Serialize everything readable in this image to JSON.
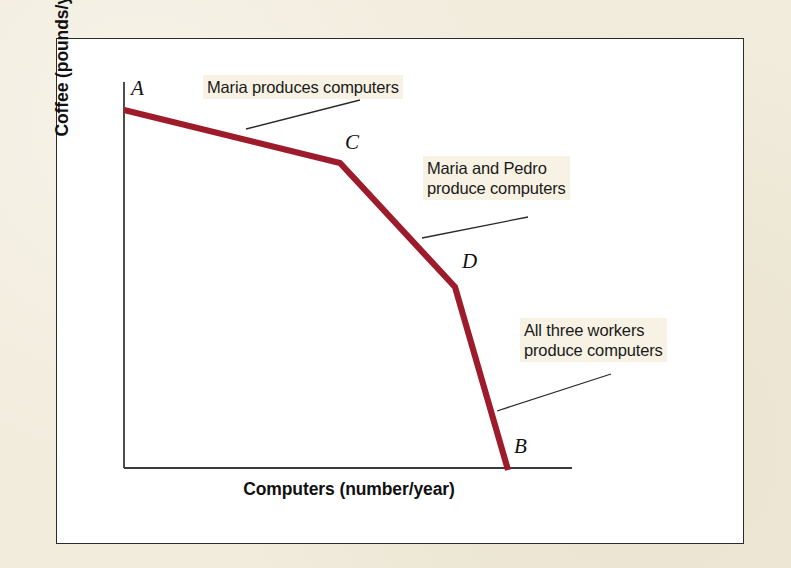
{
  "figure": {
    "kind": "production-possibilities-frontier",
    "mat_color": "#f2ecdd",
    "panel_color": "#ffffff",
    "panel_border_color": "#2b2b28",
    "curve_color": "#9e1b2b",
    "axis_color": "#3a3a38",
    "leader_color": "#2a2a28",
    "annotation_highlight": "#f7f2e4"
  },
  "axes": {
    "x_title": "Computers (number/year)",
    "y_title": "Coffee (pounds/year)",
    "x_axis_pixels": {
      "x1": 124,
      "x2": 572,
      "y": 468
    },
    "y_axis_pixels": {
      "x": 124,
      "y1": 82,
      "y2": 468
    }
  },
  "points": {
    "a": {
      "label": "A",
      "x": 124,
      "y": 110
    },
    "c": {
      "label": "C",
      "x": 340,
      "y": 163
    },
    "d": {
      "label": "D",
      "x": 455,
      "y": 287
    },
    "b": {
      "label": "B",
      "x": 508,
      "y": 468
    }
  },
  "annotations": [
    {
      "name": "maria-only",
      "lines": [
        "Maria produces computers"
      ],
      "leader": {
        "x1": 246,
        "y1": 129,
        "x2": 360,
        "y2": 100
      }
    },
    {
      "name": "maria-and-pedro",
      "lines": [
        "Maria and Pedro",
        "produce computers"
      ],
      "leader": {
        "x1": 422,
        "y1": 238,
        "x2": 528,
        "y2": 217
      }
    },
    {
      "name": "all-three-workers",
      "lines": [
        "All three workers",
        "produce computers"
      ],
      "leader": {
        "x1": 497,
        "y1": 411,
        "x2": 611,
        "y2": 374
      }
    }
  ],
  "chart_data": {
    "type": "line",
    "title": "",
    "subtitle": "",
    "xlabel": "Computers (number/year)",
    "ylabel": "Coffee (pounds/year)",
    "grid": false,
    "legend": "none",
    "axis_ticks": {
      "x": [],
      "y": []
    },
    "xlim": [
      0,
      100
    ],
    "ylim": [
      0,
      100
    ],
    "series": [
      {
        "name": "Production possibilities frontier",
        "color": "#9e1b2b",
        "point_labels": [
          "A",
          "C",
          "D",
          "B"
        ],
        "x": [
          0,
          48.2,
          73.9,
          85.7
        ],
        "y": [
          92.7,
          79.0,
          46.9,
          0.0
        ],
        "segments": [
          {
            "from": "A",
            "to": "C",
            "meaning": "Maria produces computers"
          },
          {
            "from": "C",
            "to": "D",
            "meaning": "Maria and Pedro produce computers"
          },
          {
            "from": "D",
            "to": "B",
            "meaning": "All three workers produce computers"
          }
        ]
      }
    ],
    "annotations": [
      "Maria produces computers",
      "Maria and Pedro produce computers",
      "All three workers produce computers"
    ]
  }
}
